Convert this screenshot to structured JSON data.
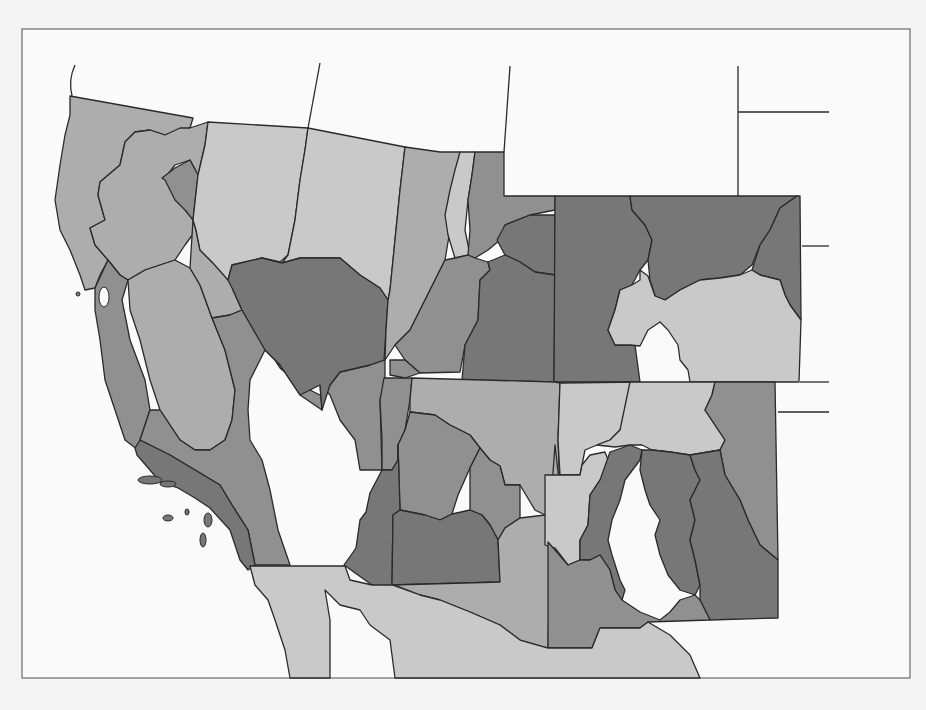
{
  "map": {
    "title": "",
    "type": "choropleth",
    "coverage": "Southwestern United States (California, Nevada, Utah, Arizona, Colorado, New Mexico) with northern Mexico",
    "frame": {
      "x": 22,
      "y": 29,
      "width": 888,
      "height": 649
    },
    "palette": {
      "background": "#f4f4f4",
      "frame_fill": "#fafafa",
      "frame_stroke": "#6a6a6a",
      "border": "#2a2a2a",
      "very_light": "#c9c9c9",
      "light": "#adadad",
      "medium": "#909090",
      "dark": "#777777",
      "mexico": "#c4c4c4"
    },
    "regions": [
      {
        "id": "ca-north-coast",
        "shade": "light",
        "points": "70,96 193,118 190,128 165,135 150,130 135,132 125,142 120,165 100,182 98,195 105,220 90,228 95,245 108,260 100,275 95,288 85,290 80,275 70,250 60,230 55,200 60,165 65,135 70,115"
      },
      {
        "id": "ca-sacramento",
        "shade": "light",
        "points": "125,142 135,132 150,130 165,135 180,128 190,128 208,122 205,145 198,175 190,160 175,165 165,178 175,195 190,205 196,230 185,245 175,260 160,265 145,270 128,280 120,275 108,260 95,245 90,228 105,220 98,195 100,182 120,165"
      },
      {
        "id": "ca-shasta-east",
        "shade": "medium",
        "points": "198,175 193,220 185,210 175,200 165,180 162,178 175,168 190,160"
      },
      {
        "id": "ca-bay",
        "shade": "medium",
        "points": "95,288 108,260 120,275 128,280 122,300 130,340 145,380 150,410 140,440 138,450 125,440 115,410 105,380 100,340 95,310"
      },
      {
        "id": "ca-san-joaquin",
        "shade": "light",
        "points": "128,280 145,270 160,265 175,260 190,268 200,285 212,318 225,350 235,390 232,420 225,440 210,450 195,450 180,440 160,410 150,380 140,340 130,310"
      },
      {
        "id": "nv-west-strip",
        "shade": "light",
        "points": "193,220 196,230 200,250 212,262 230,275 233,290 242,310 230,315 212,318 200,285 190,268"
      },
      {
        "id": "ca-southeast-desert",
        "shade": "medium",
        "points": "212,318 230,315 242,310 262,340 280,368 300,385 320,395 330,385 340,372 370,365 385,360 385,380 380,400 382,470 360,470 355,440 340,420 330,395 320,385 322,410 300,395 290,380 280,365 265,350 250,380 248,410 250,440 262,460 270,490 278,530 290,565 255,565 248,530 232,505 220,485 195,470 170,455 140,440 150,410 160,410 180,440 195,450 210,450 225,440 232,420 235,390 225,350"
      },
      {
        "id": "ca-south-coast",
        "shade": "dark",
        "points": "140,440 170,455 195,470 220,485 232,505 248,530 255,565 248,570 240,560 230,530 210,508 195,498 178,488 160,482 150,470 137,455 135,448"
      },
      {
        "id": "nv-north-west",
        "shade": "very_light",
        "points": "208,122 308,128 305,150 300,180 295,220 288,255 280,262 262,258 232,265 228,280 212,262 200,250 196,230 193,220 198,175 205,145"
      },
      {
        "id": "nv-north-east",
        "shade": "very_light",
        "points": "308,128 405,147 400,190 395,240 390,290 388,300 380,288 360,275 340,258 300,258 282,263 288,255 295,220 300,180 305,150"
      },
      {
        "id": "nv-central",
        "shade": "dark",
        "points": "232,265 262,258 282,263 300,258 340,258 360,275 380,288 388,300 386,330 384,360 370,365 340,372 330,385 322,410 320,385 300,395 290,380 280,365 265,350 242,310 233,290 228,280"
      },
      {
        "id": "ut-west",
        "shade": "light",
        "points": "405,147 440,152 460,152 455,185 450,230 445,260 425,300 410,330 395,345 385,360 386,330 388,300 390,290 395,240 400,190"
      },
      {
        "id": "ut-wasatch-strip",
        "shade": "very_light",
        "points": "460,152 475,152 472,175 468,200 465,230 470,255 455,258 448,235 445,215 450,190 455,170"
      },
      {
        "id": "ut-north-east",
        "shade": "medium",
        "points": "475,152 504,152 504,196 555,196 555,210 530,215 505,225 500,240 488,250 475,258 468,255 470,230 468,200 472,175"
      },
      {
        "id": "ut-uinta",
        "shade": "dark",
        "points": "505,225 530,215 555,215 555,275 535,272 520,262 505,255 497,240"
      },
      {
        "id": "ut-central",
        "shade": "medium",
        "points": "445,260 455,258 468,255 475,258 488,262 490,270 480,280 478,320 465,345 460,372 420,373 405,360 395,345 410,330 425,300"
      },
      {
        "id": "ut-south-east",
        "shade": "dark",
        "points": "488,262 505,255 520,262 535,272 555,275 554,382 462,380 465,345 478,320 480,280 490,270"
      },
      {
        "id": "ut-southwest-corner",
        "shade": "medium",
        "points": "390,360 405,360 420,373 405,378 390,375"
      },
      {
        "id": "co-west",
        "shade": "dark",
        "points": "555,196 630,196 632,210 645,225 652,240 648,260 640,270 632,285 620,290 615,310 608,330 615,345 635,345 640,382 554,382"
      },
      {
        "id": "co-north-central",
        "shade": "dark",
        "points": "630,196 797,196 780,208 770,230 760,245 752,265 740,275 720,278 700,280 680,290 665,300 655,296 650,280 648,260 652,240 645,225 632,210"
      },
      {
        "id": "co-northeast",
        "shade": "dark",
        "points": "797,196 800,196 801,320 790,305 785,295 780,280 760,275 752,270 760,245 770,230 780,208"
      },
      {
        "id": "co-south-plains",
        "shade": "very_light",
        "points": "640,270 648,276 655,296 665,300 680,290 700,280 720,278 740,275 752,270 760,275 780,280 785,295 790,305 801,320 799,382 690,382 688,370 680,360 678,345 668,330 660,322 648,330 640,346 630,345 615,345 608,330 615,310 620,290 632,285 640,280"
      },
      {
        "id": "az-northwest",
        "shade": "medium",
        "points": "384,378 412,378 410,400 405,430 398,445 398,460 392,470 382,470 382,440 380,400"
      },
      {
        "id": "az-north-central",
        "shade": "light",
        "points": "412,378 555,382 560,383 558,440 560,490 545,515 535,510 520,485 505,485 500,466 490,460 480,448 470,435 460,430 450,425 435,415 410,412 410,400"
      },
      {
        "id": "az-yavapai",
        "shade": "medium",
        "points": "398,445 405,430 410,412 435,415 450,425 460,430 470,435 480,448 470,468 458,495 452,514 440,520 425,515 400,510"
      },
      {
        "id": "az-gila",
        "shade": "medium",
        "points": "470,468 480,448 490,460 500,466 505,485 520,485 520,518 505,528 498,540 490,525 482,515 470,510"
      },
      {
        "id": "az-west",
        "shade": "dark",
        "points": "344,565 356,548 360,520 366,512 370,493 382,470 392,470 398,460 398,445 400,510 393,515 392,585 385,590 372,585"
      },
      {
        "id": "az-maricopa",
        "shade": "dark",
        "points": "400,510 425,515 440,520 452,514 470,510 482,515 490,525 498,540 500,582 392,585 393,515"
      },
      {
        "id": "az-southeast",
        "shade": "light",
        "points": "392,585 500,582 498,540 505,528 520,518 545,515 560,490 555,445 548,542 550,560 548,648 520,640 500,625 470,612 440,600 420,595 395,585"
      },
      {
        "id": "nm-northwest",
        "shade": "very_light",
        "points": "560,383 640,382 635,400 630,420 620,430 610,440 597,445 585,450 582,465 580,475 560,475 558,440"
      },
      {
        "id": "nm-north-central",
        "shade": "very_light",
        "points": "630,382 715,382 712,395 705,410 715,425 725,440 720,450 690,455 670,452 652,450 642,445 630,445 615,447 597,445 610,440 620,430"
      },
      {
        "id": "nm-sangre",
        "shade": "medium",
        "points": "715,382 775,382 778,560 760,545 748,520 740,500 725,475 720,450 725,440 715,425 705,410 712,395"
      },
      {
        "id": "nm-west-central",
        "shade": "very_light",
        "points": "545,475 580,475 582,465 590,455 605,452 610,465 600,480 590,495 588,525 580,540 580,560 568,565 555,548 545,545"
      },
      {
        "id": "nm-rio-grande-west",
        "shade": "dark",
        "points": "610,452 630,445 642,450 640,460 625,480 620,500 612,520 608,540 612,555 620,580 625,590 622,600 615,590 610,570 600,555 590,560 580,560 580,540 588,525 590,495 600,480"
      },
      {
        "id": "nm-central",
        "shade": "dark",
        "points": "642,450 652,450 670,452 690,455 695,470 700,480 690,500 695,520 690,540 695,560 700,585 695,595 680,590 668,575 660,555 655,535 660,520 650,505 645,490 640,470"
      },
      {
        "id": "nm-east",
        "shade": "dark",
        "points": "690,455 720,450 725,475 740,500 748,520 760,545 778,560 778,618 710,620 700,600 700,585 695,560 690,540 695,520 690,500 700,480 695,470"
      },
      {
        "id": "nm-southwest",
        "shade": "medium",
        "points": "548,542 568,565 580,560 590,560 600,555 610,570 615,590 622,600 640,612 660,620 670,612 680,600 695,595 700,600 710,620 648,622 640,628 600,628 592,648 548,648"
      },
      {
        "id": "mexico-baja",
        "shade": "very_light",
        "points": "250,566 345,566 350,580 372,585 392,585 420,595 440,600 470,612 500,625 520,640 548,648 592,648 600,628 640,628 648,622 670,635 690,655 700,678 395,678 390,640 370,625 360,610 340,605 325,590 330,620 330,678 290,678 285,650 275,620 268,600 255,585"
      }
    ],
    "islands": [
      {
        "id": "channel-island-1",
        "cx": 150,
        "cy": 480,
        "rx": 12,
        "ry": 4
      },
      {
        "id": "channel-island-2",
        "cx": 168,
        "cy": 484,
        "rx": 8,
        "ry": 3
      },
      {
        "id": "channel-island-3",
        "cx": 168,
        "cy": 518,
        "rx": 5,
        "ry": 3
      },
      {
        "id": "channel-island-4",
        "cx": 187,
        "cy": 512,
        "rx": 2,
        "ry": 3
      },
      {
        "id": "channel-island-5",
        "cx": 208,
        "cy": 520,
        "rx": 4,
        "ry": 7
      },
      {
        "id": "channel-island-6",
        "cx": 203,
        "cy": 540,
        "rx": 3,
        "ry": 7
      },
      {
        "id": "farallon-dot",
        "cx": 78,
        "cy": 294,
        "rx": 2,
        "ry": 2
      }
    ],
    "bay_water": {
      "cx": 104,
      "cy": 297,
      "rx": 5,
      "ry": 10
    },
    "extension_lines": [
      {
        "id": "oregon-west-coast",
        "d": "M 75 65 Q 68 80 72 96"
      },
      {
        "id": "ca-nv-border-north",
        "d": "M 320 63 L 308 128"
      },
      {
        "id": "id-wy-border",
        "d": "M 510 66 L 504 152"
      },
      {
        "id": "wy-east-border",
        "d": "M 738 66 L 738 196"
      },
      {
        "id": "sd-ne-border",
        "d": "M 738 112 L 829 112"
      },
      {
        "id": "ne-ks-border",
        "d": "M 802 246 L 829 246"
      },
      {
        "id": "co-south-line",
        "d": "M 800 382 L 829 382"
      },
      {
        "id": "ok-panhandle",
        "d": "M 778 412 L 829 412"
      }
    ]
  }
}
